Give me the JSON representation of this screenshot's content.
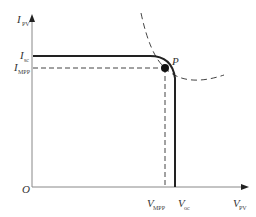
{
  "diagram": {
    "type": "pv-iv-curve",
    "axes": {
      "y_label": "I",
      "y_label_sub": "PV",
      "x_label": "V",
      "x_label_sub": "PV",
      "origin_label": "O"
    },
    "y_ticks": [
      {
        "main": "I",
        "sub": "sc"
      },
      {
        "main": "I",
        "sub": "MPP"
      }
    ],
    "x_ticks": [
      {
        "main": "V",
        "sub": "MPP"
      },
      {
        "main": "V",
        "sub": "oc"
      }
    ],
    "point_label": "P",
    "colors": {
      "curve": "#222222",
      "axis": "#777777",
      "dashed": "#444444"
    }
  }
}
